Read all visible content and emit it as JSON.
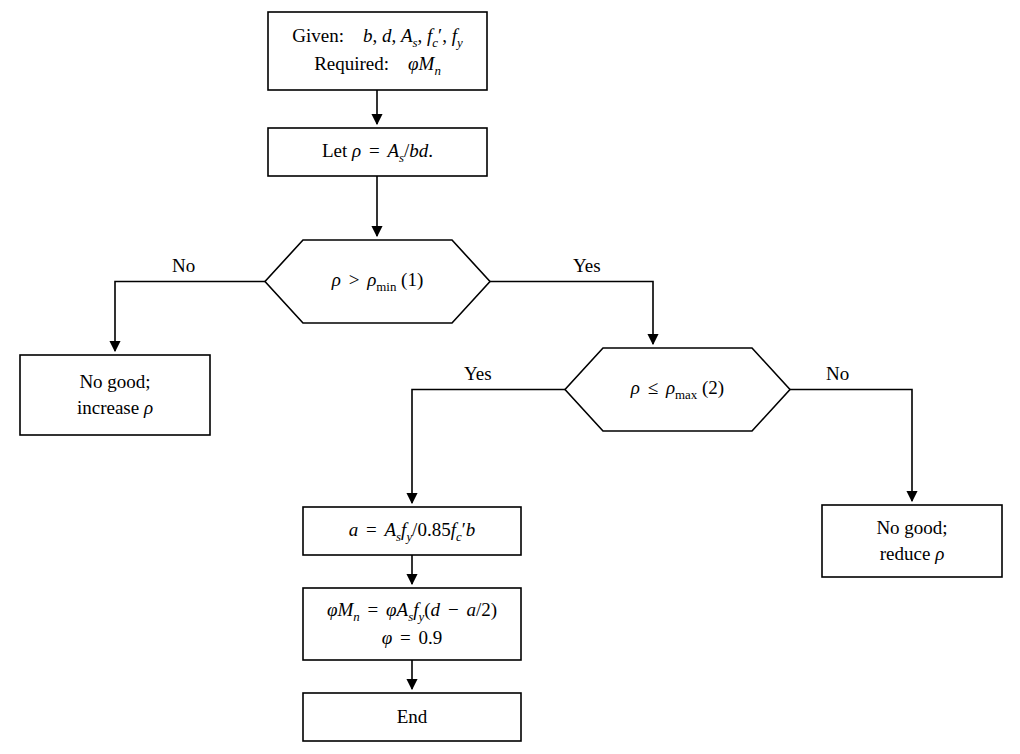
{
  "diagram": {
    "background_color": "#ffffff",
    "line_color": "#000000",
    "nodes": [
      {
        "id": "start",
        "type": "process",
        "x": 268,
        "y": 12,
        "w": 219,
        "h": 78,
        "lines": [
          "Given: b, d, Aₛ, f′ᴄ, fᵧ",
          "Required: φMₙ"
        ]
      },
      {
        "id": "let-rho",
        "type": "process",
        "x": 268,
        "y": 128,
        "w": 219,
        "h": 48,
        "lines": [
          "Let ρ = Aₛ/bd."
        ]
      },
      {
        "id": "check-min",
        "type": "decision",
        "x": 265,
        "y": 240,
        "w": 225,
        "h": 83,
        "lines": [
          "ρ > ρₘᵢₙ (1)"
        ]
      },
      {
        "id": "no-good-increase",
        "type": "process",
        "x": 20,
        "y": 355,
        "w": 190,
        "h": 80,
        "lines": [
          "No good;",
          "increase ρ"
        ]
      },
      {
        "id": "check-max",
        "type": "decision",
        "x": 565,
        "y": 348,
        "w": 225,
        "h": 83,
        "lines": [
          "ρ ≤ ρₘₐₓ (2)"
        ]
      },
      {
        "id": "no-good-reduce",
        "type": "process",
        "x": 822,
        "y": 505,
        "w": 180,
        "h": 72,
        "lines": [
          "No good;",
          "reduce ρ"
        ]
      },
      {
        "id": "calc-a",
        "type": "process",
        "x": 303,
        "y": 507,
        "w": 218,
        "h": 48,
        "lines": [
          "a = Aₛfᵧ/0.85f′ᴄb"
        ]
      },
      {
        "id": "calc-phi-mn",
        "type": "process",
        "x": 303,
        "y": 588,
        "w": 218,
        "h": 72,
        "lines": [
          "φMₙ = φAₛfᵧ(d − a/2)",
          "φ = 0.9"
        ]
      },
      {
        "id": "end",
        "type": "process",
        "x": 303,
        "y": 693,
        "w": 218,
        "h": 48,
        "lines": [
          "End"
        ]
      }
    ],
    "edge_labels": [
      {
        "id": "no-1",
        "text": "No",
        "x": 172,
        "y": 255
      },
      {
        "id": "yes-1",
        "text": "Yes",
        "x": 573,
        "y": 255
      },
      {
        "id": "yes-2",
        "text": "Yes",
        "x": 464,
        "y": 363
      },
      {
        "id": "no-2",
        "text": "No",
        "x": 826,
        "y": 363
      }
    ],
    "node_labels": {
      "start": "given-required-box",
      "let_rho": "let-rho-box",
      "check_min": "rho-greater-than-rho-min-decision",
      "no_good_increase": "no-good-increase-rho-box",
      "check_max": "rho-less-equal-rho-max-decision",
      "no_good_reduce": "no-good-reduce-rho-box",
      "calc_a": "compute-a-box",
      "calc_phi_mn": "compute-phi-mn-box",
      "end": "end-box"
    }
  }
}
